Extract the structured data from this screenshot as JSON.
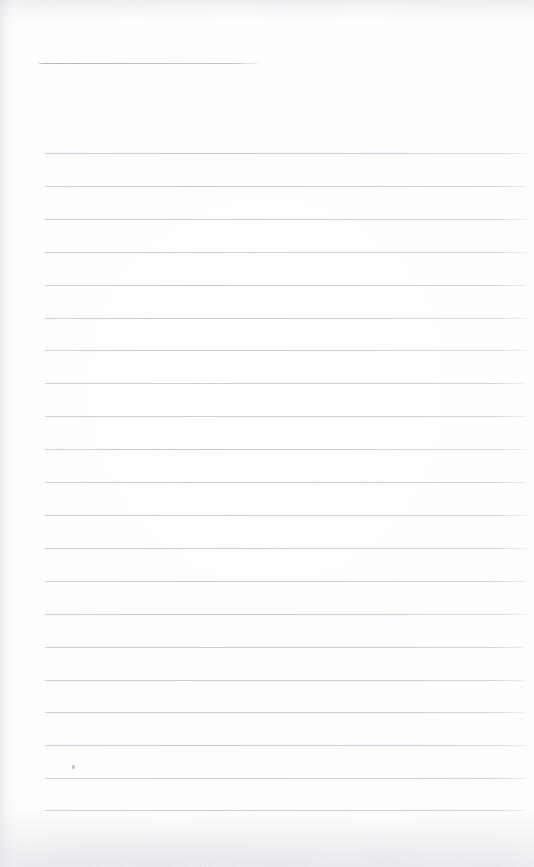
{
  "document": {
    "kind": "scanned-ruled-page",
    "title": "Blank Ruled Notebook Page",
    "content_text": "",
    "page_width": 534,
    "page_height": 867,
    "paper_color": "#fefefe",
    "rule_color": "#c9ced4",
    "header_rule_color": "#b6bcc4"
  },
  "header_rule": {
    "name": "header-rule",
    "x": 38,
    "y": 63,
    "width": 221,
    "label": "short header underline"
  },
  "ruled_lines": {
    "count": 21,
    "start_x": 44,
    "end_x": 529,
    "first_y": 153,
    "spacing": 32.85,
    "items": [
      {
        "index": 1,
        "y": 153,
        "x": 44,
        "width": 485
      },
      {
        "index": 2,
        "y": 186,
        "x": 44,
        "width": 485
      },
      {
        "index": 3,
        "y": 219,
        "x": 44,
        "width": 485
      },
      {
        "index": 4,
        "y": 252,
        "x": 44,
        "width": 485
      },
      {
        "index": 5,
        "y": 285,
        "x": 44,
        "width": 485
      },
      {
        "index": 6,
        "y": 318,
        "x": 44,
        "width": 485
      },
      {
        "index": 7,
        "y": 350,
        "x": 44,
        "width": 485
      },
      {
        "index": 8,
        "y": 383,
        "x": 44,
        "width": 485
      },
      {
        "index": 9,
        "y": 416,
        "x": 44,
        "width": 485
      },
      {
        "index": 10,
        "y": 449,
        "x": 44,
        "width": 485
      },
      {
        "index": 11,
        "y": 482,
        "x": 44,
        "width": 485
      },
      {
        "index": 12,
        "y": 515,
        "x": 44,
        "width": 485
      },
      {
        "index": 13,
        "y": 548,
        "x": 44,
        "width": 485
      },
      {
        "index": 14,
        "y": 581,
        "x": 44,
        "width": 485
      },
      {
        "index": 15,
        "y": 614,
        "x": 44,
        "width": 485
      },
      {
        "index": 16,
        "y": 647,
        "x": 44,
        "width": 485
      },
      {
        "index": 17,
        "y": 680,
        "x": 44,
        "width": 485
      },
      {
        "index": 18,
        "y": 712,
        "x": 44,
        "width": 485
      },
      {
        "index": 19,
        "y": 745,
        "x": 44,
        "width": 485
      },
      {
        "index": 20,
        "y": 778,
        "x": 44,
        "width": 485
      },
      {
        "index": 21,
        "y": 810,
        "x": 44,
        "width": 485
      }
    ]
  },
  "artifacts": {
    "speck": {
      "name": "dust-speck",
      "x": 72,
      "y": 765
    },
    "left_edge_shadow": true,
    "top_edge_shadow": true,
    "bottom_edge_noise": true
  }
}
